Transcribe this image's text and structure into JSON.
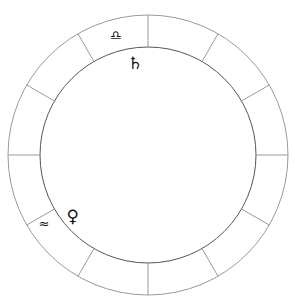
{
  "chart": {
    "center": [
      148,
      155
    ],
    "outer_radius": 140,
    "inner_radius": 108,
    "divisions": 12,
    "line_color": "#9a9a9a",
    "signs": [
      {
        "name": "libra",
        "glyph": "♎︎",
        "angle_deg": 105,
        "radius": 124
      },
      {
        "name": "aquarius",
        "glyph": "≈",
        "angle_deg": 213,
        "radius": 124
      }
    ],
    "planets": [
      {
        "name": "saturn",
        "glyph": "♄",
        "angle_deg": 98,
        "radius": 93
      },
      {
        "name": "venus",
        "glyph": "♀",
        "angle_deg": 219,
        "radius": 97
      }
    ]
  }
}
